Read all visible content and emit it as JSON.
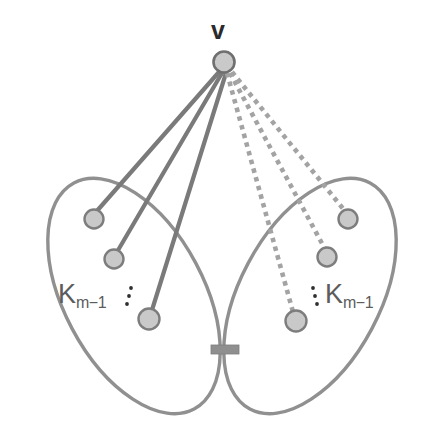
{
  "figure": {
    "type": "graph-diagram"
  },
  "labels": {
    "apex_vertex": "v",
    "clique_left_base": "K",
    "clique_left_subscript": "m−1",
    "clique_right_base": "K",
    "clique_right_subscript": "m−1",
    "ellipsis_left": "⋮",
    "ellipsis_right": "⋮"
  },
  "colors": {
    "node_fill": "#c9c9c9",
    "node_stroke": "#7d7d7d",
    "edge_solid": "#7a7a7a",
    "edge_dotted": "#a0a0a0",
    "ellipse_stroke": "#909090",
    "bridge_fill": "#8f8f8f",
    "label_dark": "#2a2a2a",
    "label_gray": "#5c5c5c",
    "background": "#ffffff"
  },
  "geometry": {
    "canvas": {
      "width": 446,
      "height": 446
    },
    "apex": {
      "cx": 224,
      "cy": 62,
      "r": 10.5
    },
    "left_clique": {
      "ellipse": {
        "cx": 134,
        "cy": 296,
        "rx": 70,
        "ry": 128,
        "rotate": -28
      },
      "nodes": [
        {
          "id": "L1",
          "cx": 94,
          "cy": 219,
          "r": 9.5
        },
        {
          "id": "L2",
          "cx": 114,
          "cy": 259,
          "r": 9.5
        },
        {
          "id": "L3",
          "cx": 149,
          "cy": 319,
          "r": 10.5
        }
      ],
      "ellipsis_dots": [
        {
          "cx": 131,
          "cy": 288,
          "r": 1.8
        },
        {
          "cx": 129,
          "cy": 296,
          "r": 1.8
        },
        {
          "cx": 127,
          "cy": 304,
          "r": 1.8
        }
      ],
      "label_pos": {
        "x": 58,
        "y": 279
      }
    },
    "right_clique": {
      "ellipse": {
        "cx": 310,
        "cy": 296,
        "rx": 70,
        "ry": 128,
        "rotate": 28
      },
      "nodes": [
        {
          "id": "R1",
          "cx": 348,
          "cy": 219,
          "r": 9.5
        },
        {
          "id": "R2",
          "cx": 327,
          "cy": 257,
          "r": 9.5
        },
        {
          "id": "R3",
          "cx": 296,
          "cy": 321,
          "r": 10.5
        }
      ],
      "ellipsis_dots": [
        {
          "cx": 313,
          "cy": 288,
          "r": 1.8
        },
        {
          "cx": 315,
          "cy": 296,
          "r": 1.8
        },
        {
          "cx": 317,
          "cy": 304,
          "r": 1.8
        }
      ],
      "label_pos": {
        "x": 325,
        "y": 279
      }
    },
    "bridge": {
      "x": 211,
      "y": 345,
      "width": 28,
      "height": 9
    },
    "solid_edges": [
      {
        "from": "v",
        "to": "L1"
      },
      {
        "from": "v",
        "to": "L2"
      },
      {
        "from": "v",
        "to": "L3"
      }
    ],
    "dotted_edges": [
      {
        "from": "v",
        "to": "R1"
      },
      {
        "from": "v",
        "to": "R2"
      },
      {
        "from": "v",
        "to": "R3"
      }
    ]
  }
}
